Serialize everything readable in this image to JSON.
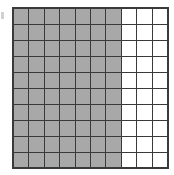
{
  "figure": {
    "name": "shaded-fraction-grid",
    "background_color": "#ffffff",
    "artifact": {
      "name": "edge-speck",
      "color": "#c9c9c9"
    }
  },
  "chart_data": {
    "type": "heatmap",
    "title": "",
    "subtitle": "",
    "xlabel": "",
    "ylabel": "",
    "rows": 10,
    "columns": 10,
    "total_cells": 100,
    "shaded_cells": 70,
    "unshaded_cells": 30,
    "shaded_columns": 7,
    "unshaded_columns": 3,
    "fraction_shaded": "70/100",
    "decimal_shaded": 0.7,
    "percent_shaded": "70%",
    "categories": [
      "1",
      "2",
      "3",
      "4",
      "5",
      "6",
      "7",
      "8",
      "9",
      "10"
    ],
    "tick_labels": [],
    "legend": [],
    "annotations": [],
    "grid": true,
    "colors": {
      "shaded": "#a8a8a8",
      "unshaded": "#ffffff",
      "gridline": "#3a3a3a",
      "border": "#3a3a3a"
    },
    "cell_values": [
      [
        1,
        1,
        1,
        1,
        1,
        1,
        1,
        0,
        0,
        0
      ],
      [
        1,
        1,
        1,
        1,
        1,
        1,
        1,
        0,
        0,
        0
      ],
      [
        1,
        1,
        1,
        1,
        1,
        1,
        1,
        0,
        0,
        0
      ],
      [
        1,
        1,
        1,
        1,
        1,
        1,
        1,
        0,
        0,
        0
      ],
      [
        1,
        1,
        1,
        1,
        1,
        1,
        1,
        0,
        0,
        0
      ],
      [
        1,
        1,
        1,
        1,
        1,
        1,
        1,
        0,
        0,
        0
      ],
      [
        1,
        1,
        1,
        1,
        1,
        1,
        1,
        0,
        0,
        0
      ],
      [
        1,
        1,
        1,
        1,
        1,
        1,
        1,
        0,
        0,
        0
      ],
      [
        1,
        1,
        1,
        1,
        1,
        1,
        1,
        0,
        0,
        0
      ],
      [
        1,
        1,
        1,
        1,
        1,
        1,
        1,
        0,
        0,
        0
      ]
    ]
  }
}
